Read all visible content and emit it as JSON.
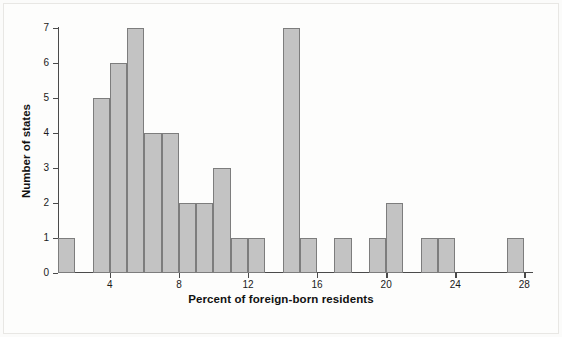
{
  "chart_data": {
    "type": "bar",
    "title": "",
    "subtitle": "",
    "xlabel": "Percent of foreign-born residents",
    "ylabel": "Number of states",
    "xlim": [
      1,
      28.5
    ],
    "ylim": [
      0,
      7
    ],
    "grid": false,
    "legend": null,
    "bin_width": 1,
    "xticks": [
      4,
      8,
      12,
      16,
      20,
      24,
      28
    ],
    "xtick_labels": [
      "4",
      "8",
      "12",
      "16",
      "20",
      "24",
      "28"
    ],
    "yticks": [
      0,
      1,
      2,
      3,
      4,
      5,
      6,
      7
    ],
    "ytick_labels": [
      "0",
      "1",
      "2",
      "3",
      "4",
      "5",
      "6",
      "7"
    ],
    "bin_starts": [
      1,
      2,
      3,
      4,
      5,
      6,
      7,
      8,
      9,
      10,
      11,
      12,
      13,
      14,
      15,
      16,
      17,
      18,
      19,
      20,
      21,
      22,
      23,
      24,
      25,
      26,
      27
    ],
    "bin_labels": [
      "1-2",
      "2-3",
      "3-4",
      "4-5",
      "5-6",
      "6-7",
      "7-8",
      "8-9",
      "9-10",
      "10-11",
      "11-12",
      "12-13",
      "13-14",
      "14-15",
      "15-16",
      "16-17",
      "17-18",
      "18-19",
      "19-20",
      "20-21",
      "21-22",
      "22-23",
      "23-24",
      "24-25",
      "25-26",
      "26-27",
      "27-28"
    ],
    "values": [
      1,
      0,
      5,
      6,
      7,
      4,
      4,
      2,
      2,
      3,
      1,
      1,
      0,
      7,
      1,
      0,
      1,
      0,
      1,
      2,
      0,
      1,
      1,
      0,
      0,
      0,
      1
    ],
    "bar_fill_color": "#c3c3c3",
    "bar_edge_color": "#7d7d7d",
    "axis_color": "#4a4a4a",
    "background_color": "#fdfdfc"
  }
}
